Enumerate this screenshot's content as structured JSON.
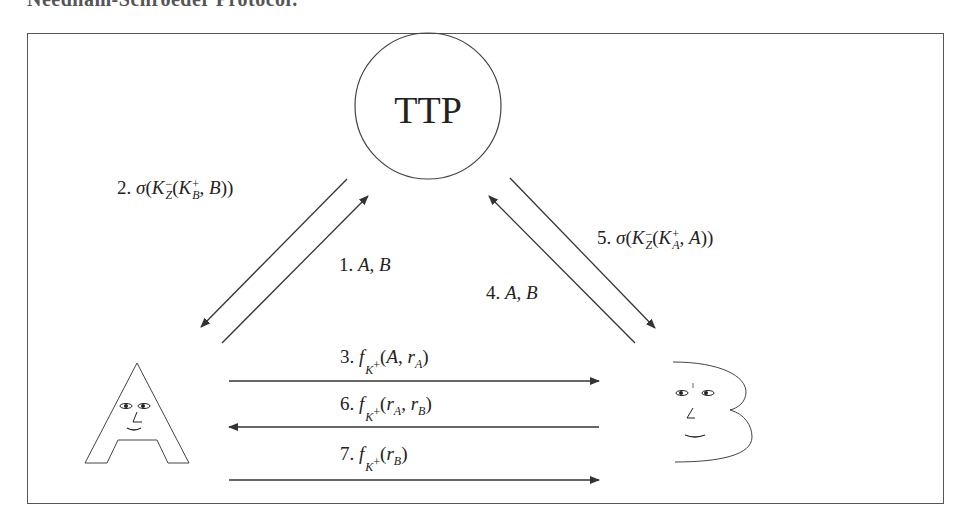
{
  "caption": "Needham-Schroeder Protocol:",
  "ttp": {
    "label": "TTP"
  },
  "parties": {
    "a": "A",
    "b": "B"
  },
  "messages": [
    {
      "num": "1.",
      "text": "A, B",
      "from": "A",
      "to": "TTP"
    },
    {
      "num": "2.",
      "text": "σ(K_Z^−(K_B^+, B))",
      "from": "TTP",
      "to": "A"
    },
    {
      "num": "3.",
      "text": "f_{K_B^+}(A, r_A)",
      "from": "A",
      "to": "B"
    },
    {
      "num": "4.",
      "text": "A, B",
      "from": "B",
      "to": "TTP"
    },
    {
      "num": "5.",
      "text": "σ(K_Z^−(K_A^+, A))",
      "from": "TTP",
      "to": "B"
    },
    {
      "num": "6.",
      "text": "f_{K_A^+}(r_A, r_B)",
      "from": "B",
      "to": "A"
    },
    {
      "num": "7.",
      "text": "f_{K_B^+}(r_B)",
      "from": "A",
      "to": "B"
    }
  ],
  "labels": {
    "m1_num": "1.",
    "m2_num": "2.",
    "m3_num": "3.",
    "m4_num": "4.",
    "m5_num": "5.",
    "m6_num": "6.",
    "m7_num": "7.",
    "sigma": "σ",
    "f": "f",
    "K": "K",
    "Z": "Z",
    "A": "A",
    "B": "B",
    "minus": "−",
    "plus": "+",
    "r": "r"
  },
  "colors": {
    "stroke": "#333333",
    "frame": "#555555",
    "background": "#ffffff"
  }
}
